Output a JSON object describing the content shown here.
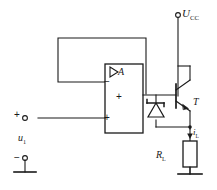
{
  "diagram": {
    "type": "electronic-schematic",
    "stroke_color": "#1a1a1a",
    "background_color": "#ffffff"
  },
  "labels": {
    "supply": "U",
    "supply_sub": "CC",
    "opamp": "A",
    "transistor": "T",
    "load_current": "i",
    "load_current_sub": "L",
    "load_resistor": "R",
    "load_resistor_sub": "L",
    "input_source": "u",
    "input_source_sub": "1"
  },
  "signs": {
    "inverting_input": "−",
    "output_plus": "+",
    "noninverting_input": "+",
    "terminal_plus": "+",
    "terminal_minus": "−"
  },
  "components": [
    {
      "name": "op-amp",
      "ref": "A",
      "terminals": [
        "inverting",
        "noninverting",
        "output"
      ]
    },
    {
      "name": "npn-transistor",
      "ref": "T",
      "terminals": [
        "base",
        "collector",
        "emitter"
      ]
    },
    {
      "name": "zener-diode",
      "ref": "",
      "terminals": [
        "anode",
        "cathode"
      ]
    },
    {
      "name": "load-resistor",
      "ref": "RL",
      "terminals": [
        "top",
        "bottom"
      ]
    },
    {
      "name": "supply-terminal",
      "ref": "UCC",
      "terminals": [
        "node"
      ]
    },
    {
      "name": "input-terminal-positive",
      "ref": "",
      "terminals": [
        "node"
      ]
    },
    {
      "name": "input-terminal-negative",
      "ref": "",
      "terminals": [
        "node"
      ]
    },
    {
      "name": "ground-input",
      "ref": "",
      "terminals": []
    },
    {
      "name": "ground-load",
      "ref": "",
      "terminals": []
    },
    {
      "name": "feedback-wire",
      "ref": "",
      "terminals": []
    }
  ]
}
